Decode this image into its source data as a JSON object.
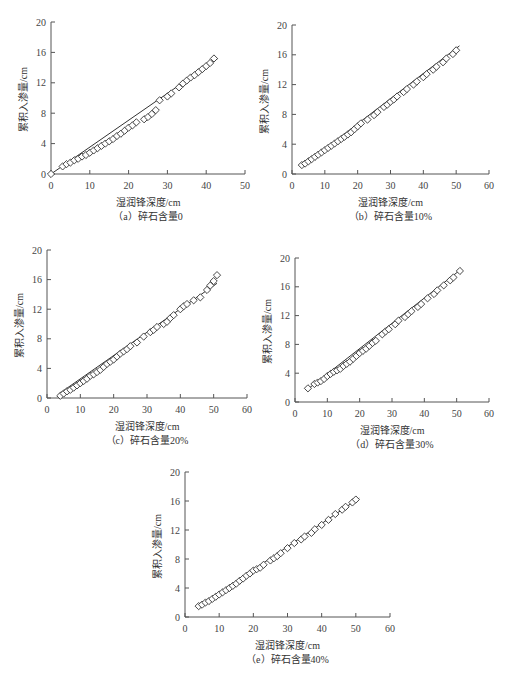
{
  "chart_data": [
    {
      "id": "a",
      "type": "scatter",
      "caption": "（a）碎石含量0",
      "xlabel": "湿润锋深度/cm",
      "ylabel": "累积入渗量/cm",
      "xlim": [
        0,
        50
      ],
      "ylim": [
        0,
        20
      ],
      "xticks": [
        0,
        10,
        20,
        30,
        40,
        50
      ],
      "yticks": [
        0,
        4,
        8,
        12,
        16,
        20
      ],
      "grid": false,
      "series": [
        {
          "name": "measured",
          "marker": "diamond",
          "x": [
            0,
            3,
            4,
            5,
            6,
            7,
            8,
            9,
            10,
            11,
            12,
            13,
            14,
            15,
            16,
            17,
            18,
            19,
            20,
            21,
            22,
            24,
            25,
            26,
            27,
            28,
            30,
            31,
            33,
            34,
            35,
            36,
            37,
            38,
            39,
            40,
            41,
            42
          ],
          "y": [
            0,
            1.0,
            1.3,
            1.5,
            1.8,
            2.0,
            2.3,
            2.5,
            2.8,
            3.1,
            3.4,
            3.7,
            4.0,
            4.3,
            4.6,
            5.0,
            5.3,
            5.7,
            6.1,
            6.4,
            6.8,
            7.2,
            7.5,
            7.9,
            8.4,
            9.7,
            10.2,
            10.6,
            11.4,
            11.9,
            12.3,
            12.7,
            13.0,
            13.4,
            13.8,
            14.2,
            14.6,
            15.2
          ]
        },
        {
          "name": "fitted",
          "type": "line",
          "x": [
            0,
            43
          ],
          "y": [
            0,
            15.2
          ]
        }
      ]
    },
    {
      "id": "b",
      "type": "scatter",
      "caption": "（b）碎石含量10%",
      "xlabel": "湿润锋深度/cm",
      "ylabel": "累积入渗量/cm",
      "xlim": [
        0,
        60
      ],
      "ylim": [
        0,
        20
      ],
      "xticks": [
        0,
        10,
        20,
        30,
        40,
        50,
        60
      ],
      "yticks": [
        0,
        4,
        8,
        12,
        16,
        20
      ],
      "grid": false,
      "series": [
        {
          "name": "measured",
          "marker": "diamond",
          "x": [
            3,
            4,
            5,
            6,
            7,
            8,
            9,
            10,
            11,
            12,
            13,
            14,
            15,
            16,
            17,
            18,
            19,
            20,
            21,
            23,
            25,
            26,
            28,
            29,
            30,
            31,
            32,
            34,
            35,
            37,
            38,
            40,
            41,
            43,
            44,
            46,
            47,
            49,
            50
          ],
          "y": [
            1.2,
            1.4,
            1.7,
            2.0,
            2.3,
            2.6,
            2.9,
            3.2,
            3.5,
            3.8,
            4.1,
            4.4,
            4.7,
            5.0,
            5.3,
            5.6,
            6.0,
            6.4,
            6.8,
            7.3,
            7.9,
            8.3,
            9.0,
            9.3,
            9.7,
            10.0,
            10.4,
            11.0,
            11.4,
            12.0,
            12.4,
            13.0,
            13.4,
            14.0,
            14.4,
            15.0,
            15.5,
            16.1,
            16.6
          ]
        },
        {
          "name": "fitted",
          "type": "line",
          "x": [
            3,
            51
          ],
          "y": [
            1.0,
            17.2
          ]
        }
      ]
    },
    {
      "id": "c",
      "type": "scatter",
      "caption": "（c）碎石含量20%",
      "xlabel": "湿润锋深度/cm",
      "ylabel": "累积入渗量/cm",
      "xlim": [
        0,
        60
      ],
      "ylim": [
        0,
        20
      ],
      "xticks": [
        0,
        10,
        20,
        30,
        40,
        50,
        60
      ],
      "yticks": [
        0,
        4,
        8,
        12,
        16,
        20
      ],
      "grid": false,
      "series": [
        {
          "name": "measured",
          "marker": "diamond",
          "x": [
            4,
            5,
            6,
            7,
            8,
            9,
            10,
            11,
            12,
            13,
            14,
            15,
            16,
            17,
            18,
            19,
            20,
            21,
            22,
            23,
            24,
            25,
            27,
            29,
            31,
            32,
            33,
            35,
            36,
            37,
            38,
            40,
            41,
            42,
            44,
            46,
            48,
            49,
            50,
            51
          ],
          "y": [
            0.3,
            0.6,
            0.9,
            1.1,
            1.4,
            1.7,
            2.0,
            2.3,
            2.6,
            3.0,
            3.2,
            3.5,
            3.8,
            4.2,
            4.6,
            4.9,
            5.2,
            5.6,
            6.0,
            6.3,
            6.6,
            7.0,
            7.5,
            8.3,
            8.9,
            9.2,
            9.6,
            10.0,
            10.3,
            10.8,
            11.2,
            12.0,
            12.4,
            12.7,
            13.2,
            13.6,
            14.6,
            15.2,
            15.8,
            16.6
          ]
        },
        {
          "name": "fitted",
          "type": "line",
          "x": [
            4,
            51
          ],
          "y": [
            0.7,
            15.5
          ]
        }
      ]
    },
    {
      "id": "d",
      "type": "scatter",
      "caption": "（d）碎石含量30%",
      "xlabel": "湿润锋深度/cm",
      "ylabel": "累积入渗量/cm",
      "xlim": [
        0,
        60
      ],
      "ylim": [
        0,
        20
      ],
      "xticks": [
        0,
        10,
        20,
        30,
        40,
        50,
        60
      ],
      "yticks": [
        0,
        4,
        8,
        12,
        16,
        20
      ],
      "grid": false,
      "series": [
        {
          "name": "measured",
          "marker": "diamond",
          "x": [
            4,
            6,
            7,
            8,
            9,
            10,
            11,
            12,
            13,
            14,
            15,
            16,
            17,
            18,
            19,
            20,
            21,
            22,
            23,
            24,
            25,
            27,
            28,
            29,
            31,
            32,
            34,
            35,
            36,
            38,
            39,
            41,
            43,
            44,
            46,
            48,
            49,
            51
          ],
          "y": [
            1.9,
            2.5,
            2.7,
            2.9,
            3.2,
            3.6,
            3.9,
            4.2,
            4.4,
            4.6,
            5.0,
            5.3,
            5.6,
            6.0,
            6.4,
            6.8,
            7.1,
            7.4,
            7.8,
            8.2,
            8.5,
            9.4,
            9.8,
            10.1,
            10.8,
            11.3,
            11.8,
            12.2,
            12.6,
            13.2,
            13.6,
            14.4,
            15.0,
            15.5,
            16.2,
            16.9,
            17.3,
            18.2
          ]
        },
        {
          "name": "fitted",
          "type": "line",
          "x": [
            4,
            51
          ],
          "y": [
            1.8,
            18.3
          ]
        }
      ]
    },
    {
      "id": "e",
      "type": "scatter",
      "caption": "（e）碎石含量40%",
      "xlabel": "湿润锋深度/cm",
      "ylabel": "累积入渗量/cm",
      "xlim": [
        0,
        60
      ],
      "ylim": [
        0,
        20
      ],
      "xticks": [
        0,
        10,
        20,
        30,
        40,
        50,
        60
      ],
      "yticks": [
        0,
        4,
        8,
        12,
        16,
        20
      ],
      "grid": false,
      "series": [
        {
          "name": "measured",
          "marker": "diamond",
          "x": [
            4,
            5,
            6,
            7,
            8,
            9,
            10,
            11,
            12,
            13,
            14,
            15,
            16,
            17,
            18,
            19,
            20,
            21,
            22,
            23,
            25,
            26,
            27,
            28,
            30,
            32,
            34,
            35,
            37,
            38,
            40,
            42,
            44,
            46,
            47,
            49,
            50
          ],
          "y": [
            1.5,
            1.7,
            2.0,
            2.2,
            2.5,
            2.8,
            3.1,
            3.4,
            3.7,
            4.0,
            4.3,
            4.6,
            5.0,
            5.3,
            5.7,
            6.0,
            6.4,
            6.6,
            6.8,
            7.2,
            7.8,
            8.1,
            8.4,
            8.8,
            9.5,
            10.2,
            10.7,
            11.1,
            11.6,
            12.1,
            12.7,
            13.4,
            14.2,
            14.8,
            15.2,
            15.8,
            16.2
          ]
        },
        {
          "name": "fitted",
          "type": "line",
          "x": [
            4,
            51
          ],
          "y": [
            1.4,
            16.4
          ]
        }
      ]
    }
  ],
  "layout": [
    {
      "left": 51,
      "top": 22,
      "right": 245,
      "bottom": 174
    },
    {
      "left": 292,
      "top": 25,
      "right": 489,
      "bottom": 174
    },
    {
      "left": 47,
      "top": 250,
      "right": 247,
      "bottom": 398
    },
    {
      "left": 295,
      "top": 258,
      "right": 489,
      "bottom": 402
    },
    {
      "left": 185,
      "top": 472,
      "right": 390,
      "bottom": 617
    }
  ]
}
